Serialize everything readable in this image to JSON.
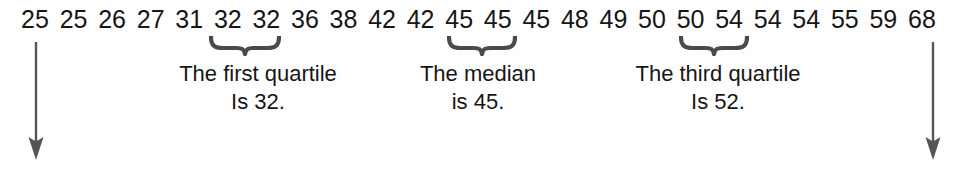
{
  "figure": {
    "type": "statistics-number-line",
    "background_color": "#ffffff",
    "text_color": "#161616",
    "mark_color": "#4a4a4a"
  },
  "data_values": [
    "25",
    "25",
    "26",
    "27",
    "31",
    "32",
    "32",
    "36",
    "38",
    "42",
    "42",
    "45",
    "45",
    "45",
    "48",
    "49",
    "50",
    "50",
    "54",
    "54",
    "54",
    "55",
    "59",
    "68"
  ],
  "braces": [
    {
      "id": "first-quartile-brace",
      "covers": [
        "32",
        "32"
      ],
      "left_px": 209,
      "width_px": 72
    },
    {
      "id": "median-brace",
      "covers": [
        "45",
        "45"
      ],
      "left_px": 447,
      "width_px": 70
    },
    {
      "id": "third-quartile-brace",
      "covers": [
        "50",
        "54"
      ],
      "left_px": 679,
      "width_px": 70
    }
  ],
  "captions": [
    {
      "id": "first-quartile-caption",
      "line1": "The first quartile",
      "line2": "Is 32.",
      "center_px": 258
    },
    {
      "id": "median-caption",
      "line1": "The median",
      "line2": "is 45.",
      "center_px": 478
    },
    {
      "id": "third-quartile-caption",
      "line1": "The third quartile",
      "line2": "Is 52.",
      "center_px": 718
    }
  ],
  "arrows": [
    {
      "id": "minimum-arrow",
      "direction": "down",
      "points_at": "25",
      "left_px": 25,
      "top_px": 42,
      "height_px": 118
    },
    {
      "id": "maximum-arrow",
      "direction": "down",
      "points_at": "68",
      "left_px": 922,
      "top_px": 42,
      "height_px": 118
    }
  ],
  "chart_data": {
    "type": "table",
    "title": "",
    "xlabel": "",
    "ylabel": "",
    "categories": [
      "25",
      "25",
      "26",
      "27",
      "31",
      "32",
      "32",
      "36",
      "38",
      "42",
      "42",
      "45",
      "45",
      "45",
      "48",
      "49",
      "50",
      "50",
      "54",
      "54",
      "54",
      "55",
      "59",
      "68"
    ],
    "values": [
      25,
      25,
      26,
      27,
      31,
      32,
      32,
      36,
      38,
      42,
      42,
      45,
      45,
      45,
      48,
      49,
      50,
      50,
      54,
      54,
      54,
      55,
      59,
      68
    ],
    "annotations": [
      "The first quartile Is 32.",
      "The median is 45.",
      "The third quartile Is 52."
    ],
    "summary_statistics": {
      "count": 24,
      "minimum": 25,
      "first_quartile": 32,
      "median": 45,
      "third_quartile": 52,
      "maximum": 68
    }
  }
}
